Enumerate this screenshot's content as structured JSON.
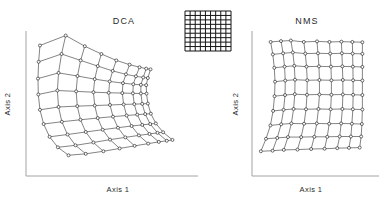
{
  "figure": {
    "background": "#ffffff",
    "ink_color": "#1d1d1d",
    "axis_color": "#9a9a9a",
    "node_fill": "#ffffff"
  },
  "panels": [
    {
      "id": "dca",
      "title": "DCA",
      "xlabel": "Axis 1",
      "ylabel": "Axis 2"
    },
    {
      "id": "nms",
      "title": "NMS",
      "xlabel": "Axis 1",
      "ylabel": "Axis 2"
    }
  ],
  "legend": {
    "name": "reference-grid",
    "rows": 9,
    "cols": 9,
    "description": "regular rectangular sampling grid"
  },
  "chart_data": {
    "type": "scatter",
    "xlabel": "Axis 1",
    "ylabel": "Axis 2",
    "grid": false,
    "legend_position": "top-center",
    "reference_grid": {
      "rows": 9,
      "cols": 9,
      "note": "Underlying true configuration is a regular 9 x 9 lattice of sample points"
    },
    "series": [
      {
        "name": "DCA",
        "note": "Severe distortion: one corner of the lattice is compressed into a dense cluster while the opposite region is stretched into a broad fan and a thin arc along the lower edge.",
        "rows": 9,
        "cols": 9,
        "points": [
          [
            0.06,
            0.905
          ],
          [
            0.215,
            0.975
          ],
          [
            0.33,
            0.9
          ],
          [
            0.43,
            0.845
          ],
          [
            0.52,
            0.8
          ],
          [
            0.6,
            0.77
          ],
          [
            0.66,
            0.752
          ],
          [
            0.7,
            0.742
          ],
          [
            0.726,
            0.737
          ],
          [
            0.052,
            0.79
          ],
          [
            0.19,
            0.845
          ],
          [
            0.305,
            0.8
          ],
          [
            0.408,
            0.76
          ],
          [
            0.498,
            0.726
          ],
          [
            0.578,
            0.702
          ],
          [
            0.638,
            0.688
          ],
          [
            0.682,
            0.68
          ],
          [
            0.71,
            0.676
          ],
          [
            0.048,
            0.672
          ],
          [
            0.172,
            0.712
          ],
          [
            0.286,
            0.69
          ],
          [
            0.39,
            0.668
          ],
          [
            0.48,
            0.652
          ],
          [
            0.56,
            0.64
          ],
          [
            0.622,
            0.632
          ],
          [
            0.668,
            0.628
          ],
          [
            0.7,
            0.626
          ],
          [
            0.05,
            0.56
          ],
          [
            0.165,
            0.588
          ],
          [
            0.278,
            0.582
          ],
          [
            0.382,
            0.576
          ],
          [
            0.474,
            0.572
          ],
          [
            0.556,
            0.57
          ],
          [
            0.62,
            0.568
          ],
          [
            0.668,
            0.567
          ],
          [
            0.702,
            0.566
          ],
          [
            0.06,
            0.452
          ],
          [
            0.172,
            0.472
          ],
          [
            0.285,
            0.478
          ],
          [
            0.39,
            0.482
          ],
          [
            0.482,
            0.486
          ],
          [
            0.564,
            0.49
          ],
          [
            0.628,
            0.492
          ],
          [
            0.676,
            0.494
          ],
          [
            0.71,
            0.496
          ],
          [
            0.082,
            0.352
          ],
          [
            0.192,
            0.368
          ],
          [
            0.304,
            0.382
          ],
          [
            0.408,
            0.394
          ],
          [
            0.5,
            0.404
          ],
          [
            0.582,
            0.412
          ],
          [
            0.646,
            0.418
          ],
          [
            0.694,
            0.422
          ],
          [
            0.728,
            0.425
          ],
          [
            0.118,
            0.262
          ],
          [
            0.226,
            0.278
          ],
          [
            0.336,
            0.296
          ],
          [
            0.438,
            0.312
          ],
          [
            0.53,
            0.326
          ],
          [
            0.612,
            0.338
          ],
          [
            0.676,
            0.346
          ],
          [
            0.724,
            0.352
          ],
          [
            0.758,
            0.356
          ],
          [
            0.168,
            0.188
          ],
          [
            0.274,
            0.202
          ],
          [
            0.382,
            0.222
          ],
          [
            0.482,
            0.242
          ],
          [
            0.574,
            0.258
          ],
          [
            0.656,
            0.272
          ],
          [
            0.72,
            0.282
          ],
          [
            0.768,
            0.29
          ],
          [
            0.802,
            0.294
          ],
          [
            0.232,
            0.132
          ],
          [
            0.336,
            0.142
          ],
          [
            0.442,
            0.16
          ],
          [
            0.54,
            0.18
          ],
          [
            0.63,
            0.198
          ],
          [
            0.712,
            0.214
          ],
          [
            0.776,
            0.226
          ],
          [
            0.824,
            0.234
          ],
          [
            0.858,
            0.24
          ]
        ]
      },
      {
        "name": "NMS",
        "note": "Grid topology is largely preserved: rows and columns remain ordered and roughly parallel, with mild shear and a waisted hourglass outline.",
        "rows": 9,
        "cols": 9,
        "points": [
          [
            0.12,
            0.93
          ],
          [
            0.205,
            0.936
          ],
          [
            0.286,
            0.94
          ],
          [
            0.392,
            0.93
          ],
          [
            0.5,
            0.934
          ],
          [
            0.602,
            0.93
          ],
          [
            0.7,
            0.932
          ],
          [
            0.79,
            0.93
          ],
          [
            0.872,
            0.928
          ],
          [
            0.138,
            0.842
          ],
          [
            0.222,
            0.85
          ],
          [
            0.302,
            0.856
          ],
          [
            0.404,
            0.848
          ],
          [
            0.508,
            0.85
          ],
          [
            0.608,
            0.848
          ],
          [
            0.704,
            0.85
          ],
          [
            0.792,
            0.848
          ],
          [
            0.872,
            0.846
          ],
          [
            0.15,
            0.748
          ],
          [
            0.234,
            0.756
          ],
          [
            0.314,
            0.762
          ],
          [
            0.414,
            0.756
          ],
          [
            0.516,
            0.758
          ],
          [
            0.614,
            0.756
          ],
          [
            0.708,
            0.758
          ],
          [
            0.794,
            0.756
          ],
          [
            0.872,
            0.754
          ],
          [
            0.156,
            0.65
          ],
          [
            0.24,
            0.658
          ],
          [
            0.32,
            0.664
          ],
          [
            0.42,
            0.66
          ],
          [
            0.52,
            0.662
          ],
          [
            0.618,
            0.66
          ],
          [
            0.712,
            0.662
          ],
          [
            0.796,
            0.66
          ],
          [
            0.872,
            0.658
          ],
          [
            0.152,
            0.548
          ],
          [
            0.238,
            0.556
          ],
          [
            0.318,
            0.562
          ],
          [
            0.418,
            0.558
          ],
          [
            0.52,
            0.56
          ],
          [
            0.618,
            0.558
          ],
          [
            0.712,
            0.56
          ],
          [
            0.796,
            0.558
          ],
          [
            0.872,
            0.556
          ],
          [
            0.14,
            0.444
          ],
          [
            0.226,
            0.452
          ],
          [
            0.308,
            0.458
          ],
          [
            0.41,
            0.456
          ],
          [
            0.512,
            0.458
          ],
          [
            0.612,
            0.456
          ],
          [
            0.708,
            0.458
          ],
          [
            0.794,
            0.456
          ],
          [
            0.872,
            0.454
          ],
          [
            0.118,
            0.342
          ],
          [
            0.206,
            0.35
          ],
          [
            0.29,
            0.356
          ],
          [
            0.394,
            0.354
          ],
          [
            0.498,
            0.356
          ],
          [
            0.6,
            0.354
          ],
          [
            0.698,
            0.356
          ],
          [
            0.786,
            0.354
          ],
          [
            0.868,
            0.352
          ],
          [
            0.082,
            0.248
          ],
          [
            0.174,
            0.254
          ],
          [
            0.262,
            0.26
          ],
          [
            0.37,
            0.26
          ],
          [
            0.478,
            0.262
          ],
          [
            0.584,
            0.262
          ],
          [
            0.686,
            0.264
          ],
          [
            0.778,
            0.264
          ],
          [
            0.862,
            0.264
          ],
          [
            0.04,
            0.16
          ],
          [
            0.136,
            0.164
          ],
          [
            0.228,
            0.17
          ],
          [
            0.34,
            0.172
          ],
          [
            0.452,
            0.176
          ],
          [
            0.562,
            0.178
          ],
          [
            0.666,
            0.182
          ],
          [
            0.762,
            0.184
          ],
          [
            0.85,
            0.186
          ]
        ]
      }
    ]
  }
}
